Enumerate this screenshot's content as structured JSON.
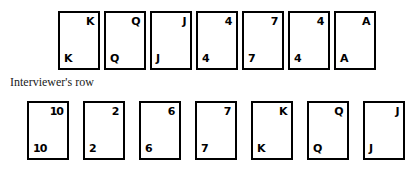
{
  "label": {
    "interviewer_row": "Interviewer's row"
  },
  "colors": {
    "card_border": "#000000",
    "card_face": "#ffffff",
    "ink": "#000000",
    "background": "#ffffff"
  },
  "rows": {
    "top": {
      "name": "candidate-row",
      "cards": [
        {
          "rank": "K"
        },
        {
          "rank": "Q"
        },
        {
          "rank": "J"
        },
        {
          "rank": "4"
        },
        {
          "rank": "7"
        },
        {
          "rank": "4"
        },
        {
          "rank": "A"
        }
      ]
    },
    "bottom": {
      "name": "interviewer-row",
      "cards": [
        {
          "rank": "10"
        },
        {
          "rank": "2"
        },
        {
          "rank": "6"
        },
        {
          "rank": "7"
        },
        {
          "rank": "K"
        },
        {
          "rank": "Q"
        },
        {
          "rank": "J"
        }
      ]
    }
  }
}
